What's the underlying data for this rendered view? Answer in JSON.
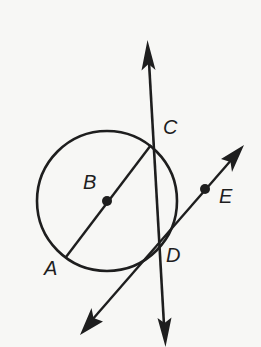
{
  "diagram": {
    "type": "geometry-figure",
    "colors": {
      "background": "#f7f7f5",
      "ink": "#1e1e1e"
    },
    "circle": {
      "center_label": "B",
      "cx": 107,
      "cy": 201,
      "r": 70
    },
    "points": [
      {
        "id": "A",
        "label": "A",
        "x": 66,
        "y": 257,
        "label_x": 44,
        "label_y": 258
      },
      {
        "id": "B",
        "label": "B",
        "x": 107,
        "y": 201,
        "label_x": 83,
        "label_y": 174
      },
      {
        "id": "C",
        "label": "C",
        "x": 151,
        "y": 145,
        "label_x": 163,
        "label_y": 120
      },
      {
        "id": "D",
        "label": "D",
        "x": 158,
        "y": 244,
        "label_x": 166,
        "label_y": 248
      },
      {
        "id": "E",
        "label": "E",
        "x": 205,
        "y": 189,
        "label_x": 219,
        "label_y": 187
      }
    ],
    "segments": [
      {
        "name": "diameter-AC",
        "from": "A",
        "to": "C"
      }
    ],
    "lines": [
      {
        "name": "line-CD-secant",
        "x1": 147,
        "y1": 42,
        "x2": 165,
        "y2": 345,
        "arrows": "both"
      },
      {
        "name": "line-DE-tangent",
        "x1": 82,
        "y1": 332,
        "x2": 243,
        "y2": 147,
        "arrows": "both"
      }
    ],
    "labels": {
      "A": "A",
      "B": "B",
      "C": "C",
      "D": "D",
      "E": "E"
    }
  }
}
